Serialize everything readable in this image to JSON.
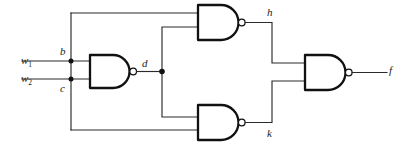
{
  "diagram": {
    "type": "logic-circuit-schematic",
    "width": 413,
    "height": 151,
    "background_color": "#ffffff",
    "wire_color": "#2b2b2b",
    "gate_outline_color": "#111111",
    "label_color": "#1a1a1a"
  },
  "labels": {
    "input_1": "w",
    "input_1_sub": "1",
    "input_2": "w",
    "input_2_sub": "2",
    "node_b": "b",
    "node_c": "c",
    "node_d": "d",
    "node_h": "h",
    "node_k": "k",
    "output_f": "f"
  },
  "gates": [
    {
      "id": "gate-nand-1",
      "type": "NAND",
      "inputs": [
        "w1",
        "w2"
      ],
      "output": "d"
    },
    {
      "id": "gate-nand-top",
      "type": "NAND",
      "inputs": [
        "b",
        "d"
      ],
      "output": "h"
    },
    {
      "id": "gate-nand-bottom",
      "type": "NAND",
      "inputs": [
        "d",
        "c"
      ],
      "output": "k"
    },
    {
      "id": "gate-nand-output",
      "type": "NAND",
      "inputs": [
        "h",
        "k"
      ],
      "output": "f"
    }
  ],
  "nets": [
    {
      "name": "b",
      "from": "w1",
      "to": "gate-nand-top input 1"
    },
    {
      "name": "c",
      "from": "w2",
      "to": "gate-nand-bottom input 2"
    },
    {
      "name": "d",
      "from": "gate-nand-1 output",
      "to": "gate-nand-top input 2, gate-nand-bottom input 1"
    },
    {
      "name": "h",
      "from": "gate-nand-top output",
      "to": "gate-nand-output input 1"
    },
    {
      "name": "k",
      "from": "gate-nand-bottom output",
      "to": "gate-nand-output input 2"
    },
    {
      "name": "f",
      "from": "gate-nand-output output",
      "to": "circuit output"
    }
  ]
}
